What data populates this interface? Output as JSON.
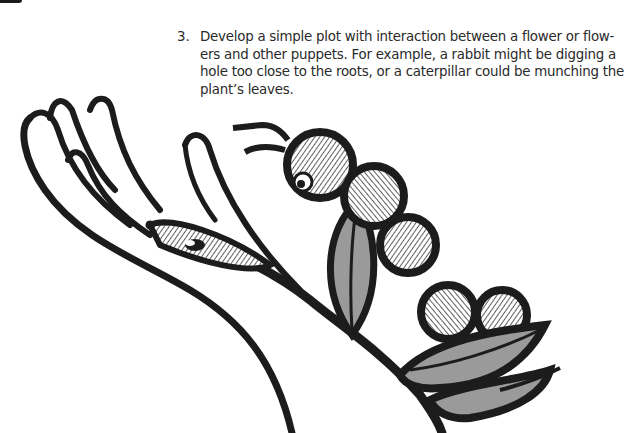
{
  "document": {
    "type": "book-page",
    "list_item": {
      "number": "3.",
      "lines": [
        "Develop a simple plot with interaction between a flower or flow-",
        "ers and other puppets.  For example, a rabbit might be digging a",
        "hole too close to the roots, or a caterpillar could be munching the",
        "plant’s leaves."
      ]
    },
    "illustration": {
      "subject": "hand holding a plant stem with leaves and a caterpillar",
      "elements": [
        "hand",
        "caterpillar",
        "leaves",
        "stem"
      ],
      "colors": {
        "ink": "#1c1c1c",
        "leaf_fill": "#9a9a9a",
        "paper": "#ffffff"
      }
    }
  }
}
